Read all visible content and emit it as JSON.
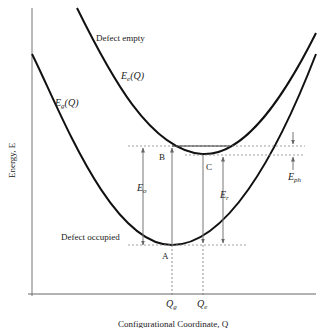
{
  "diagram": {
    "type": "configuration-coordinate-diagram",
    "axes": {
      "ylabel": "Energy, E",
      "xlabel": "Configurational Coordinate, Q",
      "x_ticks": [
        "Q_g",
        "Q_e"
      ]
    },
    "curves": [
      {
        "name": "E_e(Q)",
        "label_main": "E",
        "label_sub": "e",
        "label_tail": "(Q)",
        "state": "Defect empty"
      },
      {
        "name": "E_g(Q)",
        "label_main": "E",
        "label_sub": "g",
        "label_tail": "(Q)",
        "state": "Defect occupied"
      }
    ],
    "points": [
      "A",
      "B",
      "C"
    ],
    "energies": [
      {
        "name": "E_o",
        "main": "E",
        "sub": "o"
      },
      {
        "name": "E_r",
        "main": "E",
        "sub": "r"
      },
      {
        "name": "E_ph",
        "main": "E",
        "sub": "ph"
      }
    ],
    "colors": {
      "curve": "#111111",
      "axis": "#666666",
      "arrow": "#777777",
      "dashed": "#888888"
    }
  }
}
